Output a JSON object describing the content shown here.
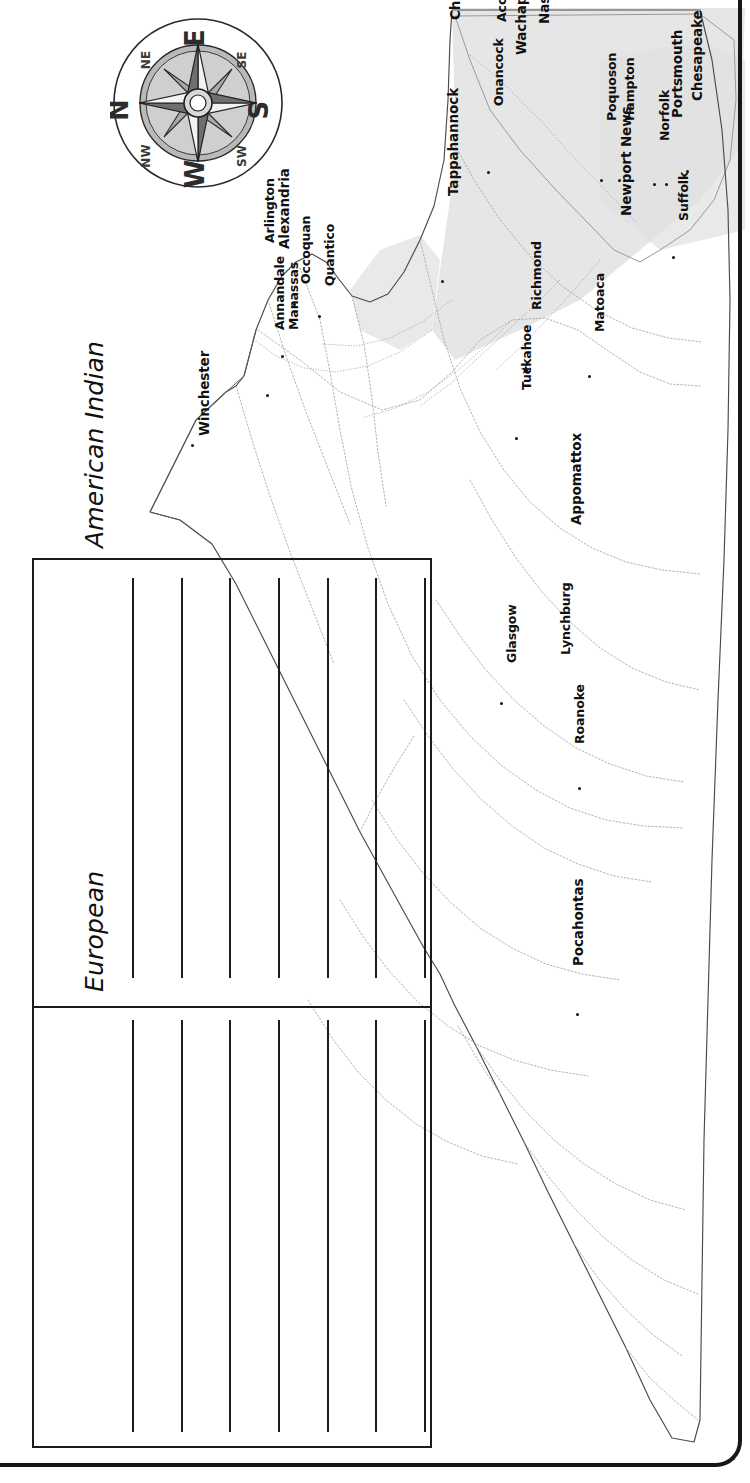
{
  "document": {
    "type": "worksheet-map",
    "orientation_note": "map rotated 90 degrees on page",
    "page_bg": "#ffffff",
    "ink_color": "#111111",
    "water_fill": "#dcdcdc"
  },
  "compass": {
    "name": "compass-rose",
    "cardinals": [
      "N",
      "E",
      "S",
      "W"
    ],
    "intercardinals": [
      "NE",
      "SE",
      "SW",
      "NW"
    ],
    "rotation_deg": -90
  },
  "map": {
    "title": "Virginia",
    "state_outline_color": "#3a3a3a",
    "county_line_color": "#8e8e8e",
    "bay_shading": "#dedede",
    "capital_marker": "star",
    "city_marker": "dot",
    "cities": [
      {
        "name": "Winchester",
        "x": 196,
        "y": 436,
        "marker": "dot",
        "dot_x": 191,
        "dot_y": 444
      },
      {
        "name": "Annandale",
        "x": 272,
        "y": 330,
        "marker": "dot",
        "dot_x": 266,
        "dot_y": 394
      },
      {
        "name": "Arlington",
        "x": 262,
        "y": 243,
        "marker": "none"
      },
      {
        "name": "Alexandria",
        "x": 276,
        "y": 249,
        "marker": "none"
      },
      {
        "name": "Manassas",
        "x": 286,
        "y": 330,
        "marker": "dot",
        "dot_x": 281,
        "dot_y": 355
      },
      {
        "name": "Occoquan",
        "x": 298,
        "y": 284,
        "marker": "dot",
        "dot_x": 293,
        "dot_y": 303
      },
      {
        "name": "Quantico",
        "x": 322,
        "y": 286,
        "marker": "dot",
        "dot_x": 318,
        "dot_y": 315
      },
      {
        "name": "Tappahannock",
        "x": 445,
        "y": 196,
        "marker": "dot",
        "dot_x": 441,
        "dot_y": 280
      },
      {
        "name": "Chincoteague",
        "x": 447,
        "y": 20,
        "marker": "none"
      },
      {
        "name": "Accomac",
        "x": 494,
        "y": 22,
        "marker": "none"
      },
      {
        "name": "Onancock",
        "x": 491,
        "y": 106,
        "marker": "dot",
        "dot_x": 487,
        "dot_y": 171
      },
      {
        "name": "Wachapreague",
        "x": 513,
        "y": 55,
        "marker": "none"
      },
      {
        "name": "Nassawadox",
        "x": 536,
        "y": 24,
        "marker": "none"
      },
      {
        "name": "Tuckahoe",
        "x": 519,
        "y": 390,
        "marker": "dot",
        "dot_x": 515,
        "dot_y": 437
      },
      {
        "name": "Richmond",
        "x": 529,
        "y": 310,
        "marker": "star",
        "dot_x": 524,
        "dot_y": 368
      },
      {
        "name": "Matoaca",
        "x": 592,
        "y": 332,
        "marker": "dot",
        "dot_x": 588,
        "dot_y": 375
      },
      {
        "name": "Newport News",
        "x": 618,
        "y": 216,
        "marker": "none"
      },
      {
        "name": "Poquoson",
        "x": 604,
        "y": 121,
        "marker": "dot",
        "dot_x": 600,
        "dot_y": 179
      },
      {
        "name": "Hampton",
        "x": 622,
        "y": 121,
        "marker": "dot",
        "dot_x": 618,
        "dot_y": 179
      },
      {
        "name": "Norfolk",
        "x": 657,
        "y": 141,
        "marker": "dot",
        "dot_x": 653,
        "dot_y": 183
      },
      {
        "name": "Portsmouth",
        "x": 669,
        "y": 118,
        "marker": "dot",
        "dot_x": 665,
        "dot_y": 183
      },
      {
        "name": "Chesapeake",
        "x": 689,
        "y": 101,
        "marker": "dot",
        "dot_x": 686,
        "dot_y": 170
      },
      {
        "name": "Suffolk",
        "x": 676,
        "y": 221,
        "marker": "dot",
        "dot_x": 672,
        "dot_y": 256
      },
      {
        "name": "Appomattox",
        "x": 568,
        "y": 525,
        "marker": "none"
      },
      {
        "name": "Glasgow",
        "x": 504,
        "y": 663,
        "marker": "dot",
        "dot_x": 500,
        "dot_y": 702
      },
      {
        "name": "Lynchburg",
        "x": 558,
        "y": 655,
        "marker": "none"
      },
      {
        "name": "Roanoke",
        "x": 572,
        "y": 744,
        "marker": "dot",
        "dot_x": 578,
        "dot_y": 787
      },
      {
        "name": "Pocahontas",
        "x": 570,
        "y": 966,
        "marker": "dot",
        "dot_x": 576,
        "dot_y": 1013
      }
    ]
  },
  "worksheet": {
    "name": "vocabulary-answer-box",
    "sections": [
      {
        "id": "american-indian",
        "label": "American Indian",
        "lines": 7
      },
      {
        "id": "european",
        "label": "European",
        "lines": 7
      }
    ],
    "line_count_total": 14
  }
}
